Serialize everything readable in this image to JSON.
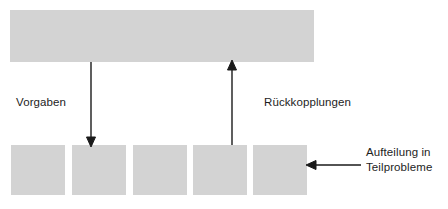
{
  "diagram": {
    "type": "block-flow-diagram",
    "language": "de",
    "colors": {
      "block_fill": "#d3d3d3",
      "arrow": "#1a1a1a",
      "text": "#1d1d1d",
      "background": "#ffffff"
    },
    "top_block": {
      "name": "overall-problem-block",
      "label": ""
    },
    "sub_blocks": [
      {
        "label": ""
      },
      {
        "label": ""
      },
      {
        "label": ""
      },
      {
        "label": ""
      },
      {
        "label": ""
      }
    ],
    "labels": {
      "vorgaben": "Vorgaben",
      "rueckkopplungen": "Rückkopplungen",
      "aufteilung_line1": "Aufteilung in",
      "aufteilung_line2": "Teilprobleme"
    },
    "arrows": [
      {
        "name": "arrow-down-vorgaben",
        "direction": "down",
        "from": "top-block",
        "to": "sub-block-2"
      },
      {
        "name": "arrow-up-rueckkopplungen",
        "direction": "up",
        "from": "sub-block-4",
        "to": "top-block"
      },
      {
        "name": "arrow-left-aufteilung",
        "direction": "left",
        "from": "aufteilung-label",
        "to": "sub-block-5"
      }
    ]
  }
}
